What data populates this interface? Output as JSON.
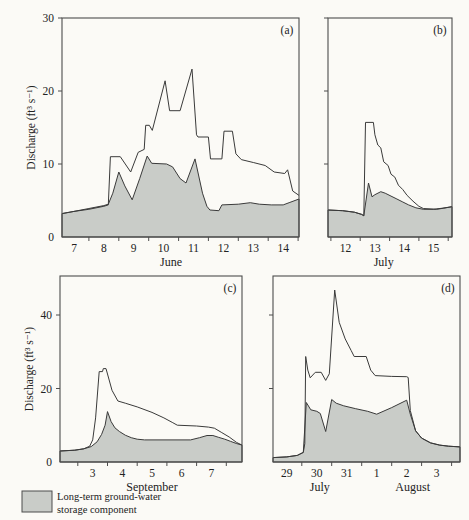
{
  "figure": {
    "y_axis_label": "Discharge (ft³ s⁻¹)",
    "legend": {
      "line1": "Long-term ground-water",
      "line2": "storage component",
      "swatch": "shaded-gray-box"
    },
    "colors": {
      "background": "#fbfaf6",
      "shade": "#c9ccc8",
      "line": "#3a3a3a",
      "frame": "#4d4d4d",
      "text": "#222222"
    }
  },
  "chart_data": [
    {
      "type": "area",
      "letter": "(a)",
      "x_domain": [
        6.6,
        14.53
      ],
      "y_domain": [
        0,
        30
      ],
      "y_ticks": [
        0,
        10,
        20,
        30
      ],
      "show_y_tick_labels": true,
      "show_y_axis_title": true,
      "x_boundary_ticks": [
        7.5,
        8.5,
        9.5,
        10.5,
        11.5,
        12.5,
        13.5,
        14.5
      ],
      "x_day_labels": [
        {
          "day": 7,
          "text": "7"
        },
        {
          "day": 8,
          "text": "8"
        },
        {
          "day": 9,
          "text": "9"
        },
        {
          "day": 10,
          "text": "10"
        },
        {
          "day": 11,
          "text": "11"
        },
        {
          "day": 12,
          "text": "12"
        },
        {
          "day": 13,
          "text": "13"
        },
        {
          "day": 14,
          "text": "14"
        }
      ],
      "month_labels": [
        {
          "text": "June",
          "day": 10.25
        }
      ],
      "series": [
        {
          "name": "total-discharge",
          "points": [
            [
              6.6,
              3.2
            ],
            [
              7.0,
              3.5
            ],
            [
              7.5,
              3.8
            ],
            [
              8.0,
              4.2
            ],
            [
              8.15,
              4.4
            ],
            [
              8.22,
              11.0
            ],
            [
              8.55,
              11.0
            ],
            [
              8.9,
              8.9
            ],
            [
              9.15,
              11.6
            ],
            [
              9.35,
              12.0
            ],
            [
              9.4,
              15.3
            ],
            [
              9.52,
              15.3
            ],
            [
              9.62,
              14.6
            ],
            [
              10.05,
              21.4
            ],
            [
              10.2,
              17.3
            ],
            [
              10.55,
              17.3
            ],
            [
              10.95,
              23.0
            ],
            [
              11.1,
              14.0
            ],
            [
              11.15,
              13.7
            ],
            [
              11.5,
              13.7
            ],
            [
              11.57,
              10.7
            ],
            [
              11.95,
              10.7
            ],
            [
              12.02,
              14.5
            ],
            [
              12.3,
              14.5
            ],
            [
              12.42,
              11.4
            ],
            [
              12.6,
              10.6
            ],
            [
              13.0,
              10.2
            ],
            [
              13.4,
              9.8
            ],
            [
              13.7,
              8.9
            ],
            [
              14.05,
              8.7
            ],
            [
              14.15,
              9.2
            ],
            [
              14.32,
              6.3
            ],
            [
              14.53,
              5.7
            ]
          ]
        },
        {
          "name": "ground-water-component",
          "points": [
            [
              6.6,
              3.2
            ],
            [
              7.0,
              3.5
            ],
            [
              7.5,
              3.9
            ],
            [
              8.0,
              4.3
            ],
            [
              8.15,
              4.5
            ],
            [
              8.3,
              6.0
            ],
            [
              8.5,
              8.9
            ],
            [
              8.7,
              7.0
            ],
            [
              8.95,
              5.1
            ],
            [
              9.2,
              8.0
            ],
            [
              9.45,
              11.1
            ],
            [
              9.6,
              10.1
            ],
            [
              10.1,
              10.0
            ],
            [
              10.3,
              9.6
            ],
            [
              10.55,
              8.0
            ],
            [
              10.75,
              7.4
            ],
            [
              11.05,
              10.7
            ],
            [
              11.3,
              6.0
            ],
            [
              11.45,
              4.2
            ],
            [
              11.55,
              3.7
            ],
            [
              11.85,
              3.6
            ],
            [
              11.95,
              4.4
            ],
            [
              12.5,
              4.5
            ],
            [
              12.9,
              4.7
            ],
            [
              13.2,
              4.5
            ],
            [
              13.6,
              4.4
            ],
            [
              14.0,
              4.4
            ],
            [
              14.2,
              4.7
            ],
            [
              14.53,
              5.2
            ]
          ]
        }
      ]
    },
    {
      "type": "area",
      "letter": "(b)",
      "x_domain": [
        11.4,
        15.63
      ],
      "y_domain": [
        0,
        30
      ],
      "y_ticks": [
        0,
        10,
        20,
        30
      ],
      "show_y_tick_labels": false,
      "show_y_axis_title": false,
      "x_boundary_ticks": [
        11.5,
        12.5,
        13.5,
        14.5,
        15.5
      ],
      "x_day_labels": [
        {
          "day": 12,
          "text": "12"
        },
        {
          "day": 13,
          "text": "13"
        },
        {
          "day": 14,
          "text": "14"
        },
        {
          "day": 15,
          "text": "15"
        }
      ],
      "month_labels": [
        {
          "text": "July",
          "day": 13.3
        }
      ],
      "series": [
        {
          "name": "total-discharge",
          "points": [
            [
              11.4,
              3.7
            ],
            [
              11.9,
              3.6
            ],
            [
              12.3,
              3.4
            ],
            [
              12.55,
              3.1
            ],
            [
              12.62,
              2.9
            ],
            [
              12.68,
              15.7
            ],
            [
              12.95,
              15.7
            ],
            [
              13.0,
              14.0
            ],
            [
              13.1,
              12.6
            ],
            [
              13.2,
              12.2
            ],
            [
              13.3,
              10.3
            ],
            [
              13.45,
              9.8
            ],
            [
              13.55,
              8.6
            ],
            [
              13.68,
              8.2
            ],
            [
              13.8,
              7.1
            ],
            [
              13.95,
              6.5
            ],
            [
              14.1,
              5.7
            ],
            [
              14.3,
              4.9
            ],
            [
              14.5,
              4.2
            ],
            [
              14.65,
              3.9
            ],
            [
              15.1,
              3.8
            ],
            [
              15.35,
              3.95
            ],
            [
              15.63,
              4.15
            ]
          ]
        },
        {
          "name": "ground-water-component",
          "points": [
            [
              11.4,
              3.7
            ],
            [
              11.9,
              3.6
            ],
            [
              12.3,
              3.4
            ],
            [
              12.55,
              3.1
            ],
            [
              12.62,
              2.9
            ],
            [
              12.78,
              7.4
            ],
            [
              12.9,
              5.5
            ],
            [
              13.0,
              5.8
            ],
            [
              13.2,
              6.2
            ],
            [
              13.35,
              6.0
            ],
            [
              13.55,
              5.6
            ],
            [
              13.75,
              5.2
            ],
            [
              13.95,
              4.8
            ],
            [
              14.15,
              4.4
            ],
            [
              14.4,
              4.0
            ],
            [
              14.65,
              3.8
            ],
            [
              15.0,
              3.8
            ],
            [
              15.3,
              3.95
            ],
            [
              15.63,
              4.15
            ]
          ]
        }
      ]
    },
    {
      "type": "area",
      "letter": "(c)",
      "x_domain": [
        1.9,
        8.03
      ],
      "y_domain": [
        0,
        50.6
      ],
      "y_ticks": [
        0,
        20,
        40
      ],
      "show_y_tick_labels": true,
      "show_y_axis_title": true,
      "x_boundary_ticks": [
        2.5,
        3.5,
        4.5,
        5.5,
        6.5,
        7.5
      ],
      "x_day_labels": [
        {
          "day": 3,
          "text": "3"
        },
        {
          "day": 4,
          "text": "4"
        },
        {
          "day": 5,
          "text": "5"
        },
        {
          "day": 6,
          "text": "6"
        },
        {
          "day": 7,
          "text": "7"
        }
      ],
      "month_labels": [
        {
          "text": "September",
          "day": 5.0
        }
      ],
      "series": [
        {
          "name": "total-discharge",
          "points": [
            [
              1.9,
              3.0
            ],
            [
              2.4,
              3.2
            ],
            [
              2.7,
              3.6
            ],
            [
              2.9,
              4.3
            ],
            [
              3.0,
              6.0
            ],
            [
              3.1,
              12.0
            ],
            [
              3.22,
              24.6
            ],
            [
              3.33,
              24.6
            ],
            [
              3.36,
              25.4
            ],
            [
              3.45,
              25.4
            ],
            [
              3.65,
              19.5
            ],
            [
              3.85,
              16.6
            ],
            [
              4.1,
              16.0
            ],
            [
              4.5,
              15.0
            ],
            [
              5.0,
              13.5
            ],
            [
              5.4,
              12.0
            ],
            [
              5.7,
              10.7
            ],
            [
              5.85,
              10.0
            ],
            [
              6.5,
              9.8
            ],
            [
              6.9,
              9.5
            ],
            [
              7.1,
              9.2
            ],
            [
              7.35,
              8.0
            ],
            [
              7.6,
              6.8
            ],
            [
              7.85,
              5.3
            ],
            [
              8.03,
              4.6
            ]
          ]
        },
        {
          "name": "ground-water-component",
          "points": [
            [
              1.9,
              3.0
            ],
            [
              2.4,
              3.2
            ],
            [
              2.7,
              3.6
            ],
            [
              2.95,
              4.2
            ],
            [
              3.15,
              5.5
            ],
            [
              3.3,
              7.5
            ],
            [
              3.42,
              10.0
            ],
            [
              3.5,
              13.7
            ],
            [
              3.62,
              11.0
            ],
            [
              3.75,
              9.3
            ],
            [
              3.9,
              8.3
            ],
            [
              4.1,
              7.3
            ],
            [
              4.3,
              6.6
            ],
            [
              4.5,
              6.2
            ],
            [
              4.75,
              6.0
            ],
            [
              6.3,
              6.0
            ],
            [
              6.6,
              6.6
            ],
            [
              6.85,
              7.2
            ],
            [
              7.05,
              7.2
            ],
            [
              7.25,
              6.7
            ],
            [
              7.45,
              6.2
            ],
            [
              7.65,
              5.6
            ],
            [
              7.85,
              5.0
            ],
            [
              8.03,
              4.6
            ]
          ]
        }
      ]
    },
    {
      "type": "area",
      "letter": "(d)",
      "x_domain": [
        28.54,
        34.78
      ],
      "y_domain": [
        0,
        50.6
      ],
      "y_ticks": [
        0,
        20,
        40
      ],
      "show_y_tick_labels": false,
      "show_y_axis_title": false,
      "x_boundary_ticks": [
        29.5,
        30.5,
        31.5,
        32.5,
        33.5,
        34.5
      ],
      "x_day_labels": [
        {
          "day": 29,
          "text": "29"
        },
        {
          "day": 30,
          "text": "30"
        },
        {
          "day": 31,
          "text": "31"
        },
        {
          "day": 32,
          "text": "1"
        },
        {
          "day": 33,
          "text": "2"
        },
        {
          "day": 34,
          "text": "3"
        }
      ],
      "month_labels": [
        {
          "text": "July",
          "day": 30.1
        },
        {
          "text": "August",
          "day": 33.2
        }
      ],
      "series": [
        {
          "name": "total-discharge",
          "points": [
            [
              28.54,
              1.2
            ],
            [
              29.0,
              1.4
            ],
            [
              29.35,
              1.8
            ],
            [
              29.55,
              2.6
            ],
            [
              29.6,
              5.0
            ],
            [
              29.63,
              28.7
            ],
            [
              29.7,
              25.0
            ],
            [
              29.78,
              22.9
            ],
            [
              29.95,
              24.4
            ],
            [
              30.15,
              24.4
            ],
            [
              30.3,
              22.2
            ],
            [
              30.42,
              24.0
            ],
            [
              30.6,
              46.8
            ],
            [
              30.75,
              38.0
            ],
            [
              30.95,
              33.5
            ],
            [
              31.15,
              30.3
            ],
            [
              31.25,
              28.7
            ],
            [
              31.65,
              28.7
            ],
            [
              31.8,
              25.0
            ],
            [
              31.95,
              23.5
            ],
            [
              32.5,
              23.3
            ],
            [
              33.0,
              23.2
            ],
            [
              33.05,
              23.0
            ],
            [
              33.12,
              14.0
            ],
            [
              33.3,
              8.5
            ],
            [
              33.5,
              6.5
            ],
            [
              33.8,
              5.2
            ],
            [
              34.1,
              4.6
            ],
            [
              34.4,
              4.3
            ],
            [
              34.78,
              4.1
            ]
          ]
        },
        {
          "name": "ground-water-component",
          "points": [
            [
              28.54,
              1.2
            ],
            [
              29.0,
              1.4
            ],
            [
              29.35,
              1.8
            ],
            [
              29.55,
              2.6
            ],
            [
              29.65,
              16.2
            ],
            [
              29.8,
              14.2
            ],
            [
              30.0,
              13.8
            ],
            [
              30.12,
              13.2
            ],
            [
              30.3,
              8.3
            ],
            [
              30.5,
              17.0
            ],
            [
              30.65,
              16.0
            ],
            [
              30.9,
              15.3
            ],
            [
              31.3,
              14.5
            ],
            [
              31.7,
              13.8
            ],
            [
              32.0,
              13.0
            ],
            [
              32.5,
              14.8
            ],
            [
              33.0,
              16.8
            ],
            [
              33.12,
              13.0
            ],
            [
              33.3,
              8.5
            ],
            [
              33.5,
              6.5
            ],
            [
              33.8,
              5.2
            ],
            [
              34.1,
              4.6
            ],
            [
              34.4,
              4.3
            ],
            [
              34.78,
              4.1
            ]
          ]
        }
      ]
    }
  ]
}
